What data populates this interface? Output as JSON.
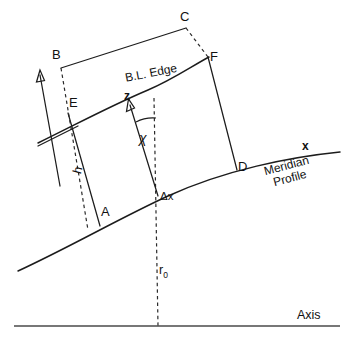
{
  "figure": {
    "type": "technical-line-diagram",
    "background_color": "#ffffff",
    "line_color": "#1c1c1c",
    "axis_color": "#4a4a4a"
  },
  "labels": {
    "point_a": "A",
    "point_b": "B",
    "point_c": "C",
    "point_d": "D",
    "point_e": "E",
    "point_f": "F",
    "bl_edge": "B.L. Edge",
    "meridian_profile": "Meridian\nProfile",
    "meridian_profile_line1": "Meridian",
    "meridian_profile_line2": "Profile",
    "axis": "Axis",
    "coord_x": "x",
    "coord_z": "z",
    "angle_chi": "χ",
    "height_h": "h",
    "delta_x": "Δx",
    "radius_r0": "r",
    "radius_r0_sub": "0"
  },
  "geometry": {
    "quadrilateral_vertices": [
      "B",
      "C",
      "F",
      "E"
    ],
    "wall_points": [
      "A",
      "D"
    ],
    "control_volume_edges": [
      "B-C",
      "C-F",
      "F-D",
      "D-A",
      "A-E",
      "E-B"
    ],
    "dashed_segments": [
      "C-F",
      "B-E-h",
      "axis-normal-r0"
    ],
    "arrows": [
      "h-direction",
      "z-direction"
    ],
    "angle_marked_between": [
      "z-axis",
      "axis-normal"
    ]
  }
}
